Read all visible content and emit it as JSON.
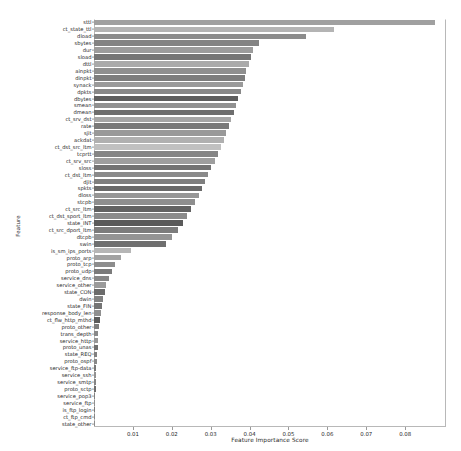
{
  "chart_data": {
    "type": "bar",
    "orientation": "horizontal",
    "title": "",
    "xlabel": "Feature Importance Score",
    "ylabel": "Feature",
    "xlim": [
      0.0,
      0.0905
    ],
    "grid": false,
    "legend": false,
    "xticks": [
      0.01,
      0.02,
      0.03,
      0.04,
      0.05,
      0.06,
      0.07,
      0.08
    ],
    "xtick_labels": [
      "0.01",
      "0.02",
      "0.03",
      "0.04",
      "0.05",
      "0.06",
      "0.07",
      "0.08"
    ],
    "categories": [
      "sttl",
      "ct_state_ttl",
      "dload",
      "sbytes",
      "dur",
      "sload",
      "dttl",
      "ainpkt",
      "dinpkt",
      "synack",
      "dpkts",
      "dbytes",
      "smean",
      "dmean",
      "ct_srv_dst",
      "rate",
      "sjit",
      "ackdat",
      "ct_dst_src_ltm",
      "tcprtt",
      "ct_srv_src",
      "sloss",
      "ct_dst_ltm",
      "djit",
      "spkts",
      "dloss",
      "stcpb",
      "ct_src_ltm",
      "ct_dst_sport_ltm",
      "state_INT",
      "ct_src_dport_ltm",
      "dtcpb",
      "swin",
      "is_sm_ips_ports",
      "proto_arp",
      "proto_tcp",
      "proto_udp",
      "service_dns",
      "service_other",
      "state_CON",
      "dwin",
      "state_FIN",
      "response_body_len",
      "ct_flw_http_mthd",
      "proto_other",
      "trans_depth",
      "service_http",
      "proto_unas",
      "state_REQ",
      "proto_ospf",
      "service_ftp-data",
      "service_ssh",
      "service_smtp",
      "proto_sctp",
      "service_pop3",
      "service_ftp",
      "is_ftp_login",
      "ct_ftp_cmd",
      "state_other"
    ],
    "values": [
      0.0878,
      0.0617,
      0.0545,
      0.0424,
      0.0409,
      0.0404,
      0.0398,
      0.0392,
      0.0387,
      0.0382,
      0.0377,
      0.0371,
      0.0365,
      0.036,
      0.0353,
      0.0347,
      0.034,
      0.0333,
      0.0326,
      0.0318,
      0.031,
      0.0302,
      0.0294,
      0.0286,
      0.0278,
      0.0269,
      0.026,
      0.025,
      0.024,
      0.0228,
      0.0215,
      0.02,
      0.0184,
      0.0096,
      0.0069,
      0.0055,
      0.0045,
      0.0038,
      0.0032,
      0.0028,
      0.0024,
      0.002,
      0.0017,
      0.0015,
      0.0013,
      0.0011,
      0.001,
      0.0009,
      0.0008,
      0.0007,
      0.0006,
      0.0005,
      0.00045,
      0.0004,
      0.00035,
      0.0003,
      0.00025,
      0.0002,
      0.0001
    ],
    "bar_colors": [
      "#a0a0a0",
      "#b4b4b4",
      "#8c8c8c",
      "#838383",
      "#9c9c9c",
      "#767676",
      "#aaaaaa",
      "#8f8f8f",
      "#7d7d7d",
      "#9a9a9a",
      "#888888",
      "#5e5e5e",
      "#919191",
      "#6e6e6e",
      "#a6a6a6",
      "#7a7a7a",
      "#999999",
      "#b0b0b0",
      "#c0c0c0",
      "#858585",
      "#9e9e9e",
      "#737373",
      "#8a8a8a",
      "#7f7f7f",
      "#6a6a6a",
      "#969696",
      "#8e8e8e",
      "#626262",
      "#8b8b8b",
      "#5a5a5a",
      "#7c7c7c",
      "#949494",
      "#6f6f6f",
      "#b6b6b6",
      "#a2a2a2",
      "#8d8d8d",
      "#7b7b7b",
      "#878787",
      "#9b9b9b",
      "#6b6b6b",
      "#828282",
      "#757575",
      "#909090",
      "#5c5c5c",
      "#7e7e7e",
      "#898989",
      "#989898",
      "#707070",
      "#808080",
      "#8a8a8a",
      "#787878",
      "#929292",
      "#858585",
      "#6d6d6d",
      "#818181",
      "#8f8f8f",
      "#797979",
      "#868686",
      "#8c8c8c"
    ]
  }
}
